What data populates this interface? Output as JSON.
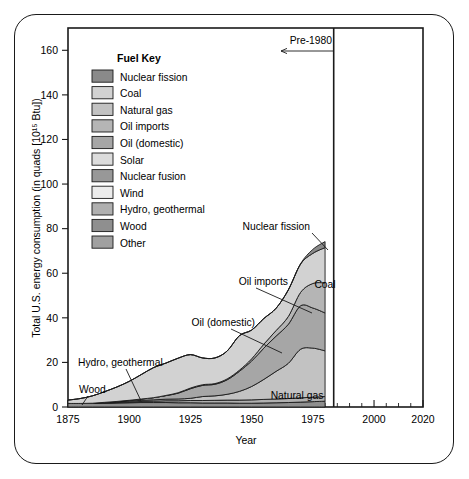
{
  "chart_data": {
    "type": "area",
    "title": "",
    "xlabel": "Year",
    "ylabel": "Total U.S. energy consumption (in quads [10¹⁵ Btu])",
    "xlim": [
      1875,
      2020
    ],
    "ylim": [
      0,
      170
    ],
    "xticks": [
      1875,
      1900,
      1925,
      1950,
      1975,
      2000,
      2020
    ],
    "xtick_labels": [
      "1875",
      "1900",
      "1925",
      "1950",
      "1975",
      "2000",
      "2020"
    ],
    "xminor_step": 5,
    "yticks": [
      0,
      20,
      40,
      60,
      80,
      100,
      120,
      140,
      160
    ],
    "ytick_labels": [
      "0",
      "20",
      "40",
      "60",
      "80",
      "100",
      "120",
      "140",
      "160"
    ],
    "grid": false,
    "legend_position": "inside-upper-left",
    "stacked": true,
    "x": [
      1875,
      1880,
      1885,
      1890,
      1895,
      1900,
      1905,
      1910,
      1915,
      1920,
      1925,
      1930,
      1935,
      1940,
      1945,
      1950,
      1955,
      1960,
      1965,
      1970,
      1975,
      1980
    ],
    "series": [
      {
        "name": "Wood",
        "values": [
          1.6,
          1.6,
          1.6,
          1.7,
          1.8,
          1.9,
          2.0,
          2.0,
          2.0,
          1.9,
          1.9,
          1.8,
          1.8,
          1.8,
          1.7,
          1.7,
          1.8,
          1.9,
          2.0,
          2.2,
          2.4,
          2.6
        ]
      },
      {
        "name": "Hydro, geothermal",
        "values": [
          0.0,
          0.0,
          0.0,
          0.1,
          0.2,
          0.3,
          0.5,
          0.6,
          0.8,
          0.9,
          1.0,
          1.1,
          1.2,
          1.3,
          1.4,
          1.5,
          1.6,
          1.7,
          1.8,
          1.9,
          2.0,
          2.1
        ]
      },
      {
        "name": "Natural gas",
        "values": [
          0.0,
          0.0,
          0.1,
          0.2,
          0.3,
          0.4,
          0.5,
          0.6,
          0.7,
          0.8,
          1.0,
          1.8,
          2.0,
          2.6,
          3.9,
          6.0,
          9.0,
          12.4,
          15.8,
          21.8,
          22.0,
          20.5
        ]
      },
      {
        "name": "Oil (domestic)",
        "values": [
          0.0,
          0.0,
          0.0,
          0.1,
          0.2,
          0.4,
          0.6,
          1.0,
          1.6,
          2.6,
          4.3,
          5.0,
          5.2,
          6.5,
          9.0,
          11.4,
          14.0,
          15.8,
          17.5,
          19.5,
          18.0,
          17.0
        ]
      },
      {
        "name": "Oil imports",
        "values": [
          0.0,
          0.0,
          0.0,
          0.0,
          0.0,
          0.0,
          0.0,
          0.0,
          0.1,
          0.2,
          0.3,
          0.3,
          0.3,
          0.4,
          0.5,
          1.0,
          1.8,
          2.5,
          3.5,
          6.0,
          11.0,
          13.5
        ]
      },
      {
        "name": "Coal",
        "values": [
          1.5,
          2.2,
          3.3,
          4.8,
          6.5,
          8.5,
          11.0,
          13.5,
          14.5,
          15.5,
          15.0,
          12.0,
          11.5,
          12.5,
          15.5,
          12.9,
          11.5,
          10.0,
          11.9,
          12.7,
          13.5,
          15.8
        ]
      },
      {
        "name": "Nuclear fission",
        "values": [
          0.0,
          0.0,
          0.0,
          0.0,
          0.0,
          0.0,
          0.0,
          0.0,
          0.0,
          0.0,
          0.0,
          0.0,
          0.0,
          0.0,
          0.0,
          0.0,
          0.0,
          0.0,
          0.1,
          0.2,
          1.8,
          2.7
        ]
      }
    ],
    "totals_note": "Total reaches about 78 quads in 1975 and about 84 quads at 1980 cut-off",
    "annotations": [
      {
        "label": "Pre-1980",
        "type": "arrow-left"
      },
      {
        "label": "Nuclear fission",
        "type": "leader"
      },
      {
        "label": "Oil imports",
        "type": "leader"
      },
      {
        "label": "Coal",
        "type": "inline"
      },
      {
        "label": "Oil (domestic)",
        "type": "leader"
      },
      {
        "label": "Natural gas",
        "type": "inline"
      },
      {
        "label": "Hydro, geothermal",
        "type": "leader"
      },
      {
        "label": "Wood",
        "type": "leader"
      }
    ]
  },
  "legend": {
    "title": "Fuel Key",
    "items": [
      {
        "label": "Nuclear fission",
        "color": "#8a8a8a"
      },
      {
        "label": "Coal",
        "color": "#d2d2d2"
      },
      {
        "label": "Natural gas",
        "color": "#c2c2c2"
      },
      {
        "label": "Oil imports",
        "color": "#b5b5b5"
      },
      {
        "label": "Oil (domestic)",
        "color": "#a6a6a6"
      },
      {
        "label": "Solar",
        "color": "#dcdcdc"
      },
      {
        "label": "Nuclear fusion",
        "color": "#989898"
      },
      {
        "label": "Wind",
        "color": "#ececec"
      },
      {
        "label": "Hydro, geothermal",
        "color": "#b0b0b0"
      },
      {
        "label": "Wood",
        "color": "#8f8f8f"
      },
      {
        "label": "Other",
        "color": "#a0a0a0"
      }
    ]
  },
  "axes": {
    "ylabel": "Total U.S. energy consumption (in quads [10¹⁵ Btu])",
    "xlabel": "Year"
  },
  "colors": {
    "outline": "#1a1a1a",
    "background": "#ffffff"
  }
}
